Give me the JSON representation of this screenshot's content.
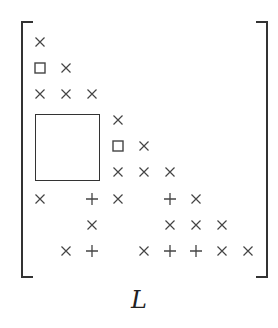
{
  "matrix": {
    "label": "L",
    "rows": 9,
    "cols": 9,
    "symbols": {
      "x": "cross-icon (nonzero entry)",
      "+": "plus-icon (fill-in entry)",
      "s": "square-icon (small block)"
    },
    "entries": [
      {
        "r": 0,
        "c": 0,
        "t": "x"
      },
      {
        "r": 1,
        "c": 0,
        "t": "s"
      },
      {
        "r": 1,
        "c": 1,
        "t": "x"
      },
      {
        "r": 2,
        "c": 0,
        "t": "x"
      },
      {
        "r": 2,
        "c": 1,
        "t": "x"
      },
      {
        "r": 2,
        "c": 2,
        "t": "x"
      },
      {
        "r": 3,
        "c": 3,
        "t": "x"
      },
      {
        "r": 4,
        "c": 3,
        "t": "s"
      },
      {
        "r": 4,
        "c": 4,
        "t": "x"
      },
      {
        "r": 5,
        "c": 3,
        "t": "x"
      },
      {
        "r": 5,
        "c": 4,
        "t": "x"
      },
      {
        "r": 5,
        "c": 5,
        "t": "x"
      },
      {
        "r": 6,
        "c": 0,
        "t": "x"
      },
      {
        "r": 6,
        "c": 2,
        "t": "+"
      },
      {
        "r": 6,
        "c": 3,
        "t": "x"
      },
      {
        "r": 6,
        "c": 5,
        "t": "+"
      },
      {
        "r": 6,
        "c": 6,
        "t": "x"
      },
      {
        "r": 7,
        "c": 2,
        "t": "x"
      },
      {
        "r": 7,
        "c": 5,
        "t": "x"
      },
      {
        "r": 7,
        "c": 6,
        "t": "x"
      },
      {
        "r": 7,
        "c": 7,
        "t": "x"
      },
      {
        "r": 8,
        "c": 1,
        "t": "x"
      },
      {
        "r": 8,
        "c": 2,
        "t": "+"
      },
      {
        "r": 8,
        "c": 4,
        "t": "x"
      },
      {
        "r": 8,
        "c": 5,
        "t": "+"
      },
      {
        "r": 8,
        "c": 6,
        "t": "+"
      },
      {
        "r": 8,
        "c": 7,
        "t": "x"
      },
      {
        "r": 8,
        "c": 8,
        "t": "x"
      }
    ],
    "big_block": {
      "row_start": 3,
      "row_end": 5,
      "col_start": 0,
      "col_end": 2
    }
  },
  "layout": {
    "col_x": [
      40,
      66,
      92,
      118,
      144,
      170,
      196,
      222,
      248
    ],
    "row_y": [
      42,
      68,
      94,
      120,
      146,
      172,
      199,
      225,
      251
    ],
    "colors": {
      "ink": "#444444",
      "bracket": "#333333"
    }
  }
}
